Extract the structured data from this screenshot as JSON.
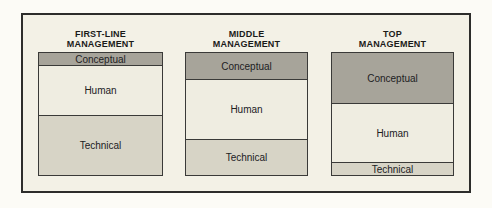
{
  "diagram": {
    "colors": {
      "conceptual": "#a7a49a",
      "human": "#efede1",
      "technical": "#d7d4c6",
      "canvas": "#f3f1e6",
      "frame_border": "#2d2d2b"
    },
    "columns": [
      {
        "header_lines": [
          "FIRST-LINE",
          "MANAGEMENT"
        ],
        "segments": [
          {
            "label": "Conceptual",
            "color_key": "conceptual",
            "height_px": 12
          },
          {
            "label": "Human",
            "color_key": "human",
            "height_px": 50
          },
          {
            "label": "Technical",
            "color_key": "technical",
            "height_px": 60
          }
        ]
      },
      {
        "header_lines": [
          "MIDDLE",
          "MANAGEMENT"
        ],
        "segments": [
          {
            "label": "Conceptual",
            "color_key": "conceptual",
            "height_px": 26
          },
          {
            "label": "Human",
            "color_key": "human",
            "height_px": 60
          },
          {
            "label": "Technical",
            "color_key": "technical",
            "height_px": 36
          }
        ]
      },
      {
        "header_lines": [
          "TOP",
          "MANAGEMENT"
        ],
        "segments": [
          {
            "label": "Conceptual",
            "color_key": "conceptual",
            "height_px": 50
          },
          {
            "label": "Human",
            "color_key": "human",
            "height_px": 59
          },
          {
            "label": "Technical",
            "color_key": "technical",
            "height_px": 13
          }
        ]
      }
    ]
  },
  "chart_data": {
    "type": "bar",
    "subtype": "stacked-columns",
    "categories": [
      "FIRST-LINE MANAGEMENT",
      "MIDDLE MANAGEMENT",
      "TOP MANAGEMENT"
    ],
    "series": [
      {
        "name": "Conceptual",
        "values": [
          12,
          26,
          50
        ]
      },
      {
        "name": "Human",
        "values": [
          50,
          60,
          59
        ]
      },
      {
        "name": "Technical",
        "values": [
          60,
          36,
          13
        ]
      }
    ],
    "value_unit": "relative height (px, proportion of skill emphasis)",
    "title": "",
    "xlabel": "",
    "ylabel": "",
    "legend_position": "none",
    "grid": false
  }
}
